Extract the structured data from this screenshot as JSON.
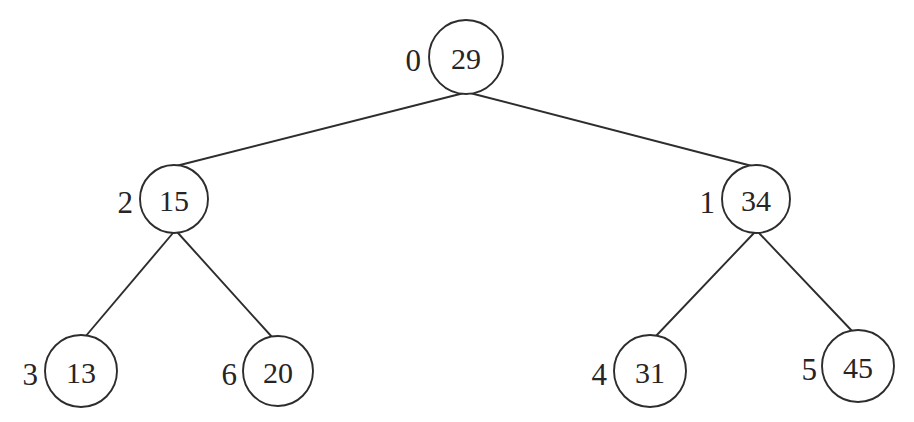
{
  "figure": {
    "type": "binary-tree-diagram",
    "background_color": "#ffffff",
    "stroke_color": "#2e2c2d",
    "text_color": "#262425",
    "width": 914,
    "height": 422
  },
  "chart_data": {
    "type": "diagram",
    "title": "",
    "xlabel": "",
    "ylabel": "",
    "nodes": [
      {
        "index": "0",
        "value": "29",
        "cx": 466,
        "cy": 57,
        "r": 37,
        "level": 0,
        "index_x": 421,
        "index_y": 60
      },
      {
        "index": "2",
        "value": "15",
        "cx": 174,
        "cy": 199,
        "r": 34,
        "level": 1,
        "index_x": 133,
        "index_y": 202
      },
      {
        "index": "1",
        "value": "34",
        "cx": 756,
        "cy": 199,
        "r": 34,
        "level": 1,
        "index_x": 715,
        "index_y": 202
      },
      {
        "index": "3",
        "value": "13",
        "cx": 81,
        "cy": 371,
        "r": 36,
        "level": 2,
        "index_x": 38,
        "index_y": 374
      },
      {
        "index": "6",
        "value": "20",
        "cx": 278,
        "cy": 371,
        "r": 35,
        "level": 2,
        "index_x": 237,
        "index_y": 374
      },
      {
        "index": "4",
        "value": "31",
        "cx": 650,
        "cy": 371,
        "r": 36,
        "level": 2,
        "index_x": 607,
        "index_y": 374
      },
      {
        "index": "5",
        "value": "45",
        "cx": 858,
        "cy": 366,
        "r": 36,
        "level": 2,
        "index_x": 817,
        "index_y": 369
      }
    ],
    "edges": [
      {
        "from": "0",
        "to": "2",
        "x1": 464,
        "y1": 93,
        "x2": 176,
        "y2": 166
      },
      {
        "from": "0",
        "to": "1",
        "x1": 470,
        "y1": 93,
        "x2": 752,
        "y2": 166
      },
      {
        "from": "2",
        "to": "3",
        "x1": 173,
        "y1": 233,
        "x2": 85,
        "y2": 337
      },
      {
        "from": "2",
        "to": "6",
        "x1": 178,
        "y1": 233,
        "x2": 272,
        "y2": 337
      },
      {
        "from": "1",
        "to": "4",
        "x1": 754,
        "y1": 233,
        "x2": 655,
        "y2": 337
      },
      {
        "from": "1",
        "to": "5",
        "x1": 759,
        "y1": 233,
        "x2": 853,
        "y2": 332
      }
    ]
  }
}
